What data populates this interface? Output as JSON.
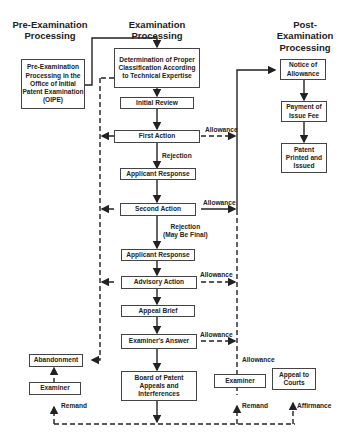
{
  "headers": {
    "pre": "Pre-Examination\nProcessing",
    "exam": "Examination\nProcessing",
    "post": "Post-\nExamination\nProcessing"
  },
  "boxes": {
    "oipe": "Pre-Examination Processing in the Office of Initial Patent Examination (OIPE)",
    "classification": "Determination of Proper Classification According to Technical Expertise",
    "initial_review": "Initial Review",
    "first_action": "First Action",
    "applicant_response_1": "Applicant Response",
    "second_action": "Second Action",
    "applicant_response_2": "Applicant Response",
    "advisory_action": "Advisory Action",
    "appeal_brief": "Appeal Brief",
    "examiners_answer": "Examiner's Answer",
    "board": "Board of Patent Appeals and Interferences",
    "abandonment": "Abandonment",
    "examiner_left": "Examiner",
    "examiner_right": "Examiner",
    "appeal_courts": "Appeal to Courts",
    "notice_allowance": "Notice of Allowance",
    "payment_fee": "Payment of Issue Fee",
    "patent_printed": "Patent Printed and Issued"
  },
  "labels": {
    "allowance_1": "Allowance",
    "allowance_2": "Allowance",
    "allowance_3": "Allowance",
    "allowance_4": "Allowance",
    "allowance_5": "Allowance",
    "rejection": "Rejection",
    "rejection_final": "Rejection\n(May Be Final)",
    "remand_left": "Remand",
    "remand_right": "Remand",
    "affirmance": "Affirmance"
  }
}
